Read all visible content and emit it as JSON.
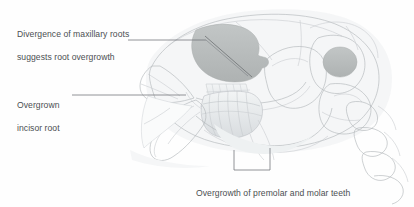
{
  "figure": {
    "background_color": "#fefefe",
    "line_color": "#b4b8bb",
    "text_color": "#4b4f52",
    "leader_color": "#6e7276",
    "highlight_fill": "#b9bdbd",
    "shadow_fill": "#e7eaec"
  },
  "annotations": [
    {
      "id": "maxillary-roots",
      "text": "Divergence of maxillary roots\nsuggests root overgrowth",
      "line1": "Divergence of maxillary roots",
      "line2": "suggests root overgrowth",
      "position": "top-left",
      "leader": "horizontal then diagonal into maxillary root mass"
    },
    {
      "id": "incisor-root",
      "text": "Overgrown\nincisor root",
      "line1": "Overgrown",
      "line2": "incisor root",
      "position": "mid-left",
      "leader": "horizontal to incisor root"
    },
    {
      "id": "premolar-molar-overgrowth",
      "text": "Overgrowth of premolar and molar teeth\nclose to breaching periosteum",
      "line1": "Overgrowth of premolar and molar teeth",
      "line2": "close to breaching periosteum",
      "position": "bottom-center",
      "leader": "bracket spanning mandibular cheek-teeth row"
    }
  ],
  "anatomy_labels": {
    "maxillary_root_mass": "maxillary-root-mass",
    "incisor": "incisor-root",
    "cheek_teeth": "premolar-molar-row",
    "cranium": "cranium",
    "tympanic_bulla": "tympanic-bulla",
    "orbit": "orbit",
    "mandible": "mandible",
    "cervical_vertebrae": "cervical-vertebrae",
    "nasal_bone": "nasal-bone",
    "zygomatic_arch": "zygomatic-arch"
  }
}
